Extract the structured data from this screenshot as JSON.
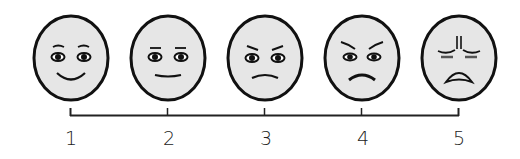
{
  "scale": {
    "title": "",
    "points": [
      {
        "value": "1",
        "expression": "smiling",
        "x": 71
      },
      {
        "value": "2",
        "expression": "neutral",
        "x": 168
      },
      {
        "value": "3",
        "expression": "slightly frowning",
        "x": 265
      },
      {
        "value": "4",
        "expression": "frowning",
        "x": 362
      },
      {
        "value": "5",
        "expression": "grimacing",
        "x": 459
      }
    ]
  },
  "colors": {
    "face_fill": "#e6e6e6",
    "stroke": "#111111",
    "background": "#ffffff"
  }
}
